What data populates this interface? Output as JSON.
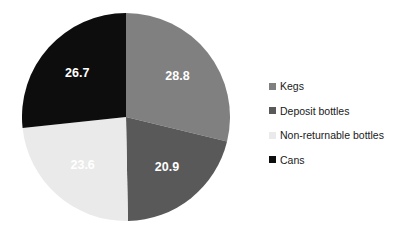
{
  "chart_data": {
    "type": "pie",
    "title": "",
    "subtitle": "",
    "xlabel": "",
    "ylabel": "",
    "grid": false,
    "legend_position": "right",
    "start_angle_deg": 0,
    "direction": "clockwise",
    "categories": [
      "Kegs",
      "Deposit bottles",
      "Non-returnable bottles",
      "Cans"
    ],
    "values": [
      28.8,
      20.9,
      23.6,
      26.7
    ],
    "total": 100.0,
    "data_labels": [
      "28.8",
      "20.9",
      "23.6",
      "26.7"
    ],
    "slice_colors": [
      "#808080",
      "#595959",
      "#eaeaea",
      "#0d0d0d"
    ],
    "data_label_color": "#ffffff",
    "background_color": "#ffffff",
    "slices": [
      {
        "label": "Kegs",
        "value": 28.8,
        "data_label": "28.8",
        "color": "#808080"
      },
      {
        "label": "Deposit bottles",
        "value": 20.9,
        "data_label": "20.9",
        "color": "#595959"
      },
      {
        "label": "Non-returnable bottles",
        "value": 23.6,
        "data_label": "23.6",
        "color": "#eaeaea"
      },
      {
        "label": "Cans",
        "value": 26.7,
        "data_label": "26.7",
        "color": "#0d0d0d"
      }
    ]
  },
  "legend": {
    "items": [
      {
        "label": "Kegs",
        "color": "#808080",
        "swatch_name": "legend-swatch-kegs"
      },
      {
        "label": "Deposit bottles",
        "color": "#595959",
        "swatch_name": "legend-swatch-deposit-bottles"
      },
      {
        "label": "Non-returnable bottles",
        "color": "#eaeaea",
        "swatch_name": "legend-swatch-non-returnable-bottles"
      },
      {
        "label": "Cans",
        "color": "#0d0d0d",
        "swatch_name": "legend-swatch-cans"
      }
    ]
  }
}
